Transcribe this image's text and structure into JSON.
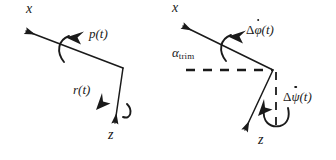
{
  "figure": {
    "type": "vector-diagram",
    "background_color": "#ffffff",
    "stroke_color": "#1a1a1a",
    "width": 336,
    "height": 160
  },
  "panels": [
    {
      "id": "left",
      "name": "body-rates-diagram",
      "axes": [
        {
          "name": "x-axis",
          "label": "x",
          "direction": "up-left",
          "arrow": true
        },
        {
          "name": "z-axis",
          "label": "z",
          "direction": "down",
          "arrow": true
        }
      ],
      "rotations": [
        {
          "name": "roll-rate",
          "label": "p(t)",
          "about": "x-axis"
        },
        {
          "name": "yaw-rate",
          "label": "r(t)",
          "about": "z-axis"
        }
      ],
      "labels": {
        "x": "x",
        "z": "z",
        "p": "p(t)",
        "r": "r(t)"
      }
    },
    {
      "id": "right",
      "name": "perturbation-rates-diagram",
      "axes": [
        {
          "name": "x-axis",
          "label": "x",
          "direction": "up-left",
          "arrow": true
        },
        {
          "name": "z-axis",
          "label": "z",
          "direction": "down-left",
          "arrow": true
        }
      ],
      "reference_lines": [
        {
          "name": "horizontal-dashed-reference",
          "style": "dashed",
          "orientation": "horizontal"
        },
        {
          "name": "vertical-dashed-reference",
          "style": "dashed",
          "orientation": "vertical"
        }
      ],
      "angles": [
        {
          "name": "trim-angle",
          "symbol": "alpha",
          "subscript": "trim",
          "text": "trim"
        }
      ],
      "rotations": [
        {
          "name": "roll-rate-perturbation",
          "delta": "Δ",
          "symbol": "φ",
          "dot": true,
          "arg": "(t)",
          "about": "x-axis"
        },
        {
          "name": "yaw-rate-perturbation",
          "delta": "Δ",
          "symbol": "ψ",
          "dot": true,
          "arg": "(t)",
          "about": "vertical-dashed-reference"
        }
      ],
      "labels": {
        "x": "x",
        "z": "z",
        "alpha": "α",
        "alpha_sub": "trim",
        "delta": "Δ",
        "phi": "φ",
        "psi": "ψ",
        "arg": "(t)"
      }
    }
  ]
}
